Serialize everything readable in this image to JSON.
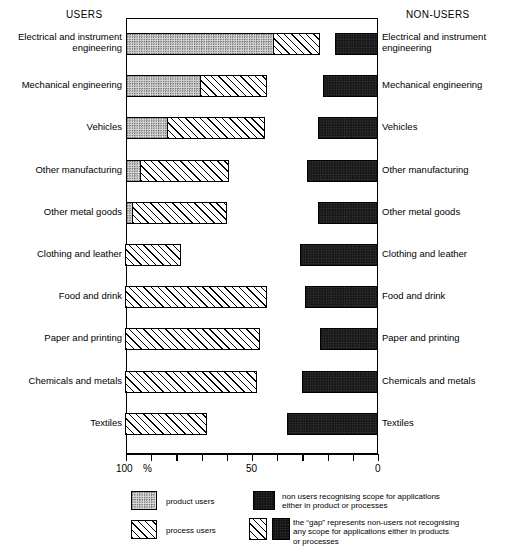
{
  "header": {
    "left_title": "USERS",
    "right_title": "NON-USERS"
  },
  "axis": {
    "label_100": "100",
    "label_percent": "%",
    "label_50": "50",
    "label_0": "0",
    "ticks": [
      100,
      90,
      80,
      70,
      60,
      50,
      40,
      30,
      20,
      10,
      0
    ]
  },
  "legend": {
    "product_users": "product users",
    "process_users": "process users",
    "non_users": "non users recognising scope for applications\neither in product or processes",
    "gap": "the “gap” represents non-users not recognising\nany scope for applications either in products\nor processes"
  },
  "chart_data": {
    "type": "bar",
    "title": "",
    "xlabel": "%",
    "ylabel": "",
    "xlim": [
      100,
      0
    ],
    "x_axis_reversed": true,
    "grid": false,
    "legend_position": "bottom",
    "categories": [
      "Electrical and instrument\nengineering",
      "Mechanical engineering",
      "Vehicles",
      "Other manufacturing",
      "Other metal goods",
      "Clothing and leather",
      "Food and drink",
      "Paper and printing",
      "Chemicals and metals",
      "Textiles"
    ],
    "series": [
      {
        "name": "product users",
        "values": [
          41,
          70,
          83,
          94,
          97,
          0,
          0,
          0,
          0,
          0
        ]
      },
      {
        "name": "process users",
        "values": [
          23,
          44,
          45,
          59,
          60,
          78,
          44,
          47,
          48,
          68
        ]
      },
      {
        "name": "non users recognising scope for applications",
        "values": [
          17,
          22,
          24,
          28,
          24,
          31,
          29,
          23,
          30,
          36
        ]
      }
    ]
  },
  "rows": [
    {
      "label_left": "Electrical and instrument\nengineering",
      "label_right": "Electrical and instrument\nengineering",
      "product": 41,
      "process": 23,
      "nonuser": 17
    },
    {
      "label_left": "Mechanical engineering",
      "label_right": "Mechanical engineering",
      "product": 70,
      "process": 44,
      "nonuser": 22
    },
    {
      "label_left": "Vehicles",
      "label_right": "Vehicles",
      "product": 83,
      "process": 45,
      "nonuser": 24
    },
    {
      "label_left": "Other manufacturing",
      "label_right": "Other manufacturing",
      "product": 94,
      "process": 59,
      "nonuser": 28
    },
    {
      "label_left": "Other metal goods",
      "label_right": "Other metal goods",
      "product": 97,
      "process": 60,
      "nonuser": 24
    },
    {
      "label_left": "Clothing and leather",
      "label_right": "Clothing and leather",
      "product": 0,
      "process": 78,
      "nonuser": 31
    },
    {
      "label_left": "Food and drink",
      "label_right": "Food and drink",
      "product": 0,
      "process": 44,
      "nonuser": 29
    },
    {
      "label_left": "Paper and printing",
      "label_right": "Paper and printing",
      "product": 0,
      "process": 47,
      "nonuser": 23
    },
    {
      "label_left": "Chemicals and metals",
      "label_right": "Chemicals and metals",
      "product": 0,
      "process": 48,
      "nonuser": 30
    },
    {
      "label_left": "Textiles",
      "label_right": "Textiles",
      "product": 0,
      "process": 68,
      "nonuser": 36
    }
  ]
}
